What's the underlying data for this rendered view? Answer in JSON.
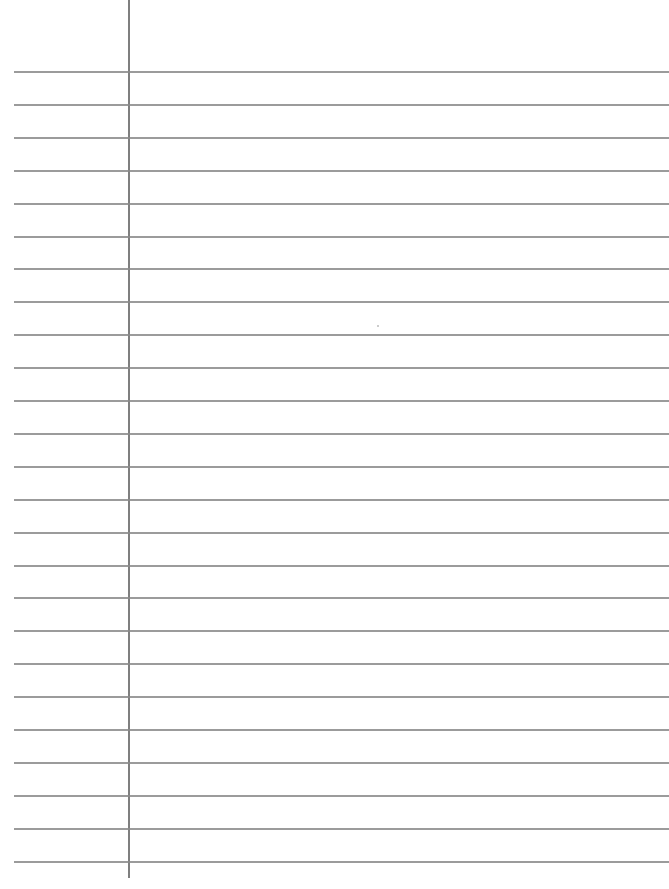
{
  "document": {
    "type": "lined-paper",
    "ruled_line_count": 25,
    "first_line_y": 71,
    "line_spacing": 32.9,
    "margin_line_x": 128,
    "colors": {
      "paper": "#ffffff",
      "rule": "#8a8a8a",
      "margin": "#7f7f7f"
    }
  }
}
